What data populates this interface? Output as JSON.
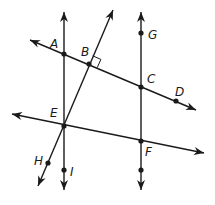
{
  "diagram": {
    "type": "geometry",
    "colors": {
      "stroke": "#1a1a1a",
      "background": "#ffffff"
    },
    "lines": [
      {
        "id": "vertical-left",
        "from": [
          64,
          190
        ],
        "to": [
          64,
          12
        ],
        "arrows": "both",
        "through": [
          "A",
          "E",
          "I"
        ]
      },
      {
        "id": "vertical-right",
        "from": [
          141,
          190
        ],
        "to": [
          141,
          12
        ],
        "arrows": "both",
        "through": [
          "G",
          "C",
          "F"
        ]
      },
      {
        "id": "line-AD",
        "from": [
          30,
          40
        ],
        "to": [
          196,
          110
        ],
        "arrows": "both",
        "through": [
          "A",
          "B",
          "C",
          "D"
        ]
      },
      {
        "id": "line-EF",
        "from": [
          12,
          114
        ],
        "to": [
          204,
          153
        ],
        "arrows": "both",
        "through": [
          "E",
          "F"
        ]
      },
      {
        "id": "transversal-HB",
        "from": [
          38,
          186
        ],
        "to": [
          113,
          10
        ],
        "arrows": "both",
        "through": [
          "H",
          "E",
          "B"
        ]
      }
    ],
    "points": [
      {
        "name": "A",
        "x": 64,
        "y": 54,
        "label_x": 50,
        "label_y": 48
      },
      {
        "name": "B",
        "x": 89,
        "y": 64,
        "label_x": 81,
        "label_y": 56
      },
      {
        "name": "C",
        "x": 141,
        "y": 87,
        "label_x": 147,
        "label_y": 83
      },
      {
        "name": "D",
        "x": 176,
        "y": 101,
        "label_x": 175,
        "label_y": 96
      },
      {
        "name": "E",
        "x": 64,
        "y": 126,
        "label_x": 50,
        "label_y": 117
      },
      {
        "name": "F",
        "x": 141,
        "y": 141,
        "label_x": 145,
        "label_y": 156
      },
      {
        "name": "G",
        "x": 141,
        "y": 33,
        "label_x": 148,
        "label_y": 39
      },
      {
        "name": "H",
        "x": 48,
        "y": 163,
        "label_x": 34,
        "label_y": 165
      },
      {
        "name": "I",
        "x": 64,
        "y": 170,
        "label_x": 70,
        "label_y": 176
      },
      {
        "name": "",
        "x": 141,
        "y": 170,
        "label_x": 0,
        "label_y": 0
      }
    ],
    "right_angle": {
      "at": "B",
      "size": 9
    },
    "labels": {
      "A": "A",
      "B": "B",
      "C": "C",
      "D": "D",
      "E": "E",
      "F": "F",
      "G": "G",
      "H": "H",
      "I": "I"
    }
  }
}
